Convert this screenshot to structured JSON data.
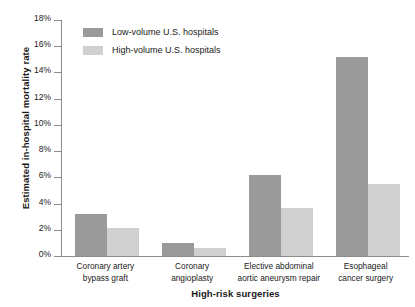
{
  "chart_data": {
    "type": "bar",
    "title": "",
    "xlabel": "High-risk surgeries",
    "ylabel": "Estimated in-hospital mortality rate",
    "ylim": [
      0,
      18
    ],
    "ytick_labels": [
      "18%",
      "16%",
      "14%",
      "12%",
      "10%",
      "8%",
      "6%",
      "4%",
      "2%",
      "0%"
    ],
    "ytick_values": [
      18,
      16,
      14,
      12,
      10,
      8,
      6,
      4,
      2,
      0
    ],
    "grid": false,
    "legend_position": "top-left-inside",
    "categories": [
      "Coronary artery\nbypass graft",
      "Coronary\nangioplasty",
      "Elective abdominal\naortic aneurysm repair",
      "Esophageal\ncancer surgery"
    ],
    "category_lines": [
      [
        "Coronary artery",
        "bypass graft"
      ],
      [
        "Coronary",
        "angioplasty"
      ],
      [
        "Elective abdominal",
        "aortic aneurysm repair"
      ],
      [
        "Esophageal",
        "cancer surgery"
      ]
    ],
    "series": [
      {
        "name": "Low-volume U.S. hospitals",
        "color": "#9a9a9a",
        "values": [
          3.2,
          1.0,
          6.2,
          15.2
        ]
      },
      {
        "name": "High-volume U.S. hospitals",
        "color": "#d0d0d0",
        "values": [
          2.1,
          0.6,
          3.7,
          5.5
        ]
      }
    ]
  },
  "legend": {
    "items": [
      {
        "label": "Low-volume U.S. hospitals",
        "swatch_class": "low"
      },
      {
        "label": "High-volume U.S. hospitals",
        "swatch_class": "high"
      }
    ]
  }
}
